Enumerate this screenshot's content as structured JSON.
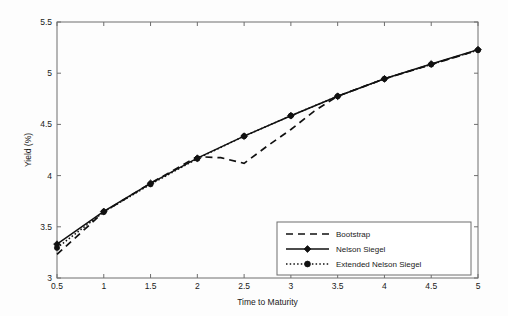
{
  "chart_data": {
    "type": "line",
    "title": "",
    "xlabel": "Time to Maturity",
    "ylabel": "Yield (%)",
    "xlim": [
      0.5,
      5
    ],
    "ylim": [
      3,
      5.5
    ],
    "xticks": [
      0.5,
      1,
      1.5,
      2,
      2.5,
      3,
      3.5,
      4,
      4.5,
      5
    ],
    "xtick_labels": [
      "0.5",
      "1",
      "1.5",
      "2",
      "2.5",
      "3",
      "3.5",
      "4",
      "4.5",
      "5"
    ],
    "yticks": [
      3,
      3.5,
      4,
      4.5,
      5,
      5.5
    ],
    "ytick_labels": [
      "3",
      "3.5",
      "4",
      "4.5",
      "5",
      "5.5"
    ],
    "grid": false,
    "legend_position": "lower right",
    "x": [
      0.5,
      1,
      1.5,
      2,
      2.5,
      3,
      3.5,
      4,
      4.5,
      5
    ],
    "series": [
      {
        "name": "Bootstrap",
        "style": "dashed",
        "marker": "none",
        "color": "#111111",
        "x": [
          0.5,
          1,
          1.5,
          2,
          2.25,
          2.5,
          2.75,
          3,
          3.25,
          3.5,
          4,
          4.5,
          5
        ],
        "values": [
          3.23,
          3.645,
          3.925,
          4.185,
          4.175,
          4.12,
          4.29,
          4.45,
          4.63,
          4.775,
          4.945,
          5.085,
          5.225
        ]
      },
      {
        "name": "Nelson Siegel",
        "style": "solid",
        "marker": "diamond",
        "color": "#111111",
        "x": [
          0.5,
          1,
          1.5,
          2,
          2.5,
          3,
          3.5,
          4,
          4.5,
          5
        ],
        "values": [
          3.33,
          3.65,
          3.925,
          4.17,
          4.385,
          4.585,
          4.775,
          4.945,
          5.09,
          5.23
        ]
      },
      {
        "name": "Extended Nelson Siegel",
        "style": "dotted",
        "marker": "circle",
        "color": "#111111",
        "x": [
          0.5,
          1,
          1.5,
          2,
          2.5,
          3,
          3.5,
          4,
          4.5,
          5
        ],
        "values": [
          3.295,
          3.645,
          3.915,
          4.165,
          4.385,
          4.585,
          4.775,
          4.945,
          5.085,
          5.225
        ]
      }
    ]
  },
  "legend": {
    "entries": [
      {
        "label": "Bootstrap"
      },
      {
        "label": "Nelson Siegel"
      },
      {
        "label": "Extended Nelson Siegel"
      }
    ]
  }
}
